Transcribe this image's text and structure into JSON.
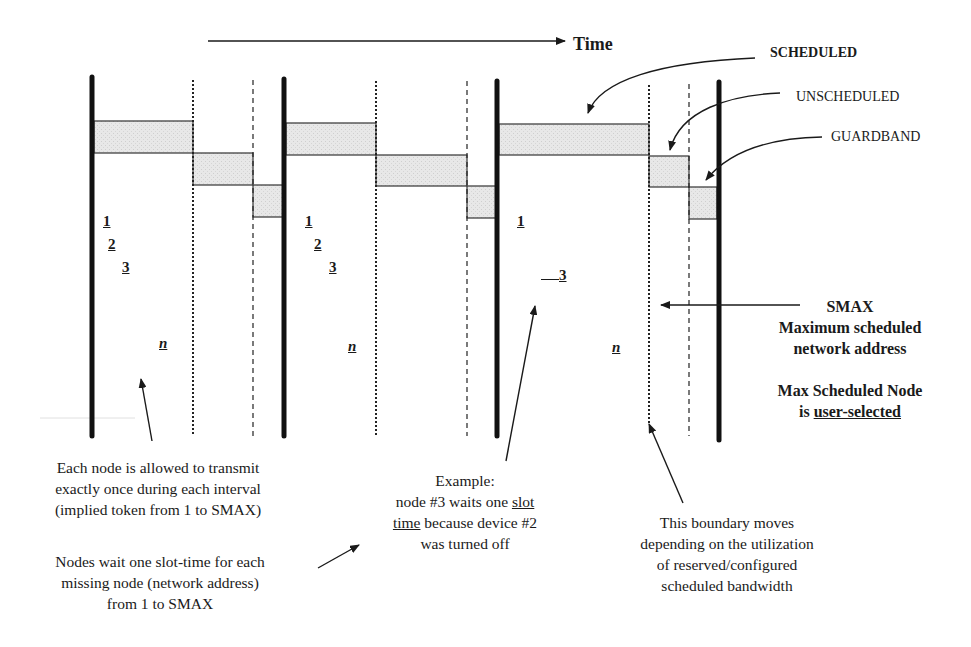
{
  "axis": {
    "label": "Time"
  },
  "legend": {
    "scheduled": "SCHEDULED",
    "unscheduled": "UNSCHEDULED",
    "guardband": "GUARDBAND"
  },
  "intervals": [
    {
      "nodes": [
        "1",
        "2",
        "3",
        "n"
      ]
    },
    {
      "nodes": [
        "1",
        "2",
        "3",
        "n"
      ]
    },
    {
      "nodes": [
        "1",
        "3",
        "n"
      ]
    }
  ],
  "smax": {
    "title": "SMAX",
    "line1": "Maximum scheduled",
    "line2": "network address",
    "line3": "Max Scheduled Node",
    "line4_prefix": "is ",
    "line4_underlined": "user-selected"
  },
  "annotations": {
    "each_node": [
      "Each node is allowed to transmit",
      "exactly once during each interval",
      "(implied token from 1 to SMAX)"
    ],
    "nodes_wait": [
      "Nodes wait one slot-time for each",
      "missing node (network address)",
      "from 1 to SMAX"
    ],
    "example": {
      "line1": "Example:",
      "line2_prefix": "node #3 waits one ",
      "line2_underlined": "slot",
      "line3_underlined": "time",
      "line3_suffix": " because device #2",
      "line4": "was turned off"
    },
    "boundary": [
      "This boundary  moves",
      "depending on the utilization",
      "of reserved/configured",
      "scheduled bandwidth"
    ]
  },
  "colors": {
    "ink": "#1a1a1a",
    "box_fill": "#e6e6e6"
  }
}
